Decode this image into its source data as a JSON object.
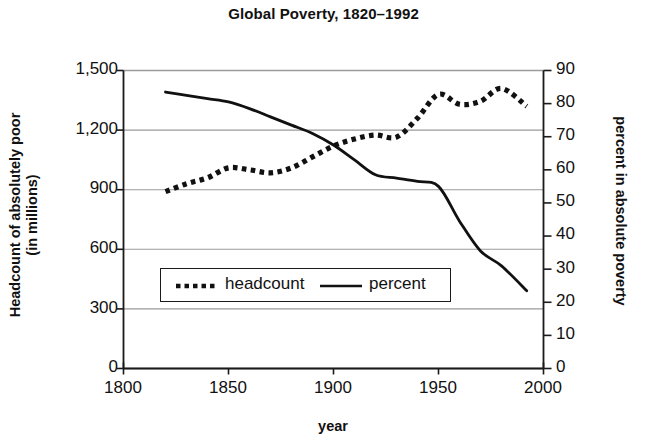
{
  "chart_data": {
    "type": "line",
    "title": "Global Poverty, 1820–1992",
    "xlabel": "year",
    "ylabel": "Headcount of absolutely poor (in millions)",
    "ylabel_line1": "Headcount of absolutely poor",
    "ylabel_line2": "(in millions)",
    "y2label": "percent in absolute poverty",
    "xlim": [
      1800,
      2000
    ],
    "ylim": [
      0,
      1500
    ],
    "y2lim": [
      0,
      90
    ],
    "xticks": [
      "1800",
      "1850",
      "1900",
      "1950",
      "2000"
    ],
    "xtick_values": [
      1800,
      1850,
      1900,
      1950,
      2000
    ],
    "yticks_left": [
      "0",
      "300",
      "600",
      "900",
      "1,200",
      "1,500"
    ],
    "ytick_left_values": [
      0,
      300,
      600,
      900,
      1200,
      1500
    ],
    "yticks_right": [
      "0",
      "10",
      "20",
      "30",
      "40",
      "50",
      "60",
      "70",
      "80",
      "90"
    ],
    "ytick_right_values": [
      0,
      10,
      20,
      30,
      40,
      50,
      60,
      70,
      80,
      90
    ],
    "grid": "horizontal",
    "legend_position": "center-left-inside",
    "legend": [
      {
        "name": "headcount",
        "style": "dotted",
        "color": "#111111"
      },
      {
        "name": "percent",
        "style": "solid",
        "color": "#111111"
      }
    ],
    "series": [
      {
        "name": "headcount",
        "axis": "left",
        "units": "millions",
        "style": "dotted",
        "x": [
          1820,
          1830,
          1840,
          1850,
          1860,
          1870,
          1880,
          1890,
          1900,
          1910,
          1920,
          1930,
          1940,
          1950,
          1960,
          1970,
          1980,
          1992
        ],
        "values": [
          890,
          930,
          960,
          1010,
          1000,
          985,
          1010,
          1065,
          1120,
          1155,
          1175,
          1165,
          1260,
          1380,
          1330,
          1345,
          1410,
          1320
        ]
      },
      {
        "name": "percent",
        "axis": "right",
        "units": "percent",
        "style": "solid",
        "x": [
          1820,
          1830,
          1840,
          1850,
          1860,
          1870,
          1880,
          1890,
          1900,
          1910,
          1920,
          1930,
          1940,
          1950,
          1960,
          1970,
          1980,
          1992
        ],
        "values": [
          83.5,
          82.5,
          81.5,
          80.5,
          78.5,
          76.0,
          73.5,
          71.0,
          67.5,
          63.0,
          58.5,
          57.5,
          56.5,
          55.0,
          44.5,
          35.5,
          31.0,
          23.5
        ]
      }
    ]
  },
  "colors": {
    "axis": "#1a1a1a",
    "grid": "#9a9a9a",
    "ink": "#111111",
    "background": "#ffffff"
  }
}
